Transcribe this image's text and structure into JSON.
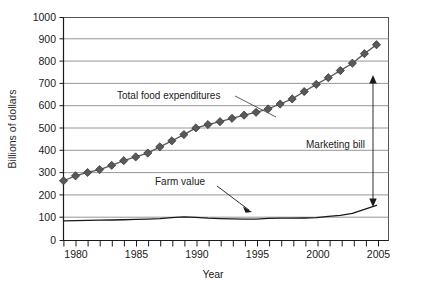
{
  "chart_data": {
    "type": "line",
    "title": "",
    "xlabel": "Year",
    "ylabel": "Billions of dollars",
    "xlim": [
      1979,
      2006
    ],
    "ylim": [
      0,
      1000
    ],
    "grid": true,
    "legend_position": "none",
    "x": [
      1979,
      1980,
      1981,
      1982,
      1983,
      1984,
      1985,
      1986,
      1987,
      1988,
      1989,
      1990,
      1991,
      1992,
      1993,
      1994,
      1995,
      1996,
      1997,
      1998,
      1999,
      2000,
      2001,
      2002,
      2003,
      2004,
      2005
    ],
    "xticklabels": [
      "1980",
      "1985",
      "1990",
      "1995",
      "2000",
      "2005"
    ],
    "xtickvalues": [
      1980,
      1985,
      1990,
      1995,
      2000,
      2005
    ],
    "yticklabels": [
      "0",
      "100",
      "200",
      "300",
      "400",
      "500",
      "600",
      "700",
      "800",
      "900",
      "1000"
    ],
    "ytickvalues": [
      0,
      100,
      200,
      300,
      400,
      500,
      600,
      700,
      800,
      900,
      1000
    ],
    "series": [
      {
        "name": "Total food expenditures",
        "marker": "diamond",
        "color": "#595959",
        "values": [
          268,
          290,
          305,
          318,
          337,
          358,
          375,
          392,
          420,
          447,
          475,
          505,
          520,
          533,
          548,
          562,
          575,
          590,
          612,
          635,
          668,
          700,
          730,
          762,
          795,
          838,
          878
        ]
      },
      {
        "name": "Farm value",
        "marker": "none",
        "color": "#1a1a1a",
        "values": [
          88,
          89,
          90,
          91,
          92,
          93,
          95,
          96,
          98,
          103,
          106,
          104,
          100,
          98,
          97,
          96,
          96,
          99,
          100,
          100,
          101,
          103,
          108,
          113,
          122,
          140,
          158
        ]
      }
    ],
    "annotations": [
      {
        "name": "total-food-expenditures-label",
        "text": "Total food expenditures",
        "x_px": 117,
        "y_px": 99,
        "leader_from_x": 235,
        "leader_from_y": 96,
        "leader_to_x": 276,
        "leader_to_y": 117
      },
      {
        "name": "farm-value-label",
        "text": "Farm value",
        "x_px": 155,
        "y_px": 185,
        "leader_from_x": 217,
        "leader_from_y": 186,
        "leader_to_x": 252,
        "leader_to_y": 212
      },
      {
        "name": "marketing-bill-label",
        "text": "Marketing bill",
        "x_px": 306,
        "y_px": 144,
        "arrow_x": 373,
        "arrow_top_y": 77,
        "arrow_bottom_y": 205
      }
    ]
  }
}
